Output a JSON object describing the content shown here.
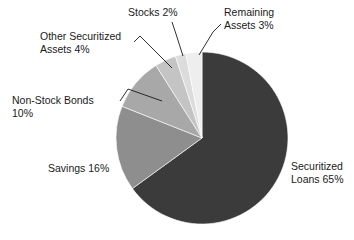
{
  "chart_data": {
    "type": "pie",
    "title": "",
    "subtitle": "",
    "xlabel": "",
    "ylabel": "",
    "legend_position": "none",
    "grid": false,
    "labels_position": "outside-with-leader-lines",
    "start_angle_deg": 0,
    "direction": "clockwise",
    "background_color": "#ffffff",
    "categories": [
      "Securitized Loans",
      "Savings",
      "Non-Stock Bonds",
      "Other Securitized Assets",
      "Stocks",
      "Remaining Assets"
    ],
    "values": [
      65,
      16,
      10,
      4,
      2,
      3
    ],
    "unit": "%",
    "colors": [
      "#3b3b3b",
      "#8e8e8e",
      "#a8a8a8",
      "#c4c4c4",
      "#dcdcdc",
      "#eeeeee"
    ],
    "slices": [
      {
        "name": "Securitized Loans",
        "value": 65,
        "display": "Securitized\nLoans 65%",
        "color": "#3b3b3b",
        "start_deg": 0,
        "end_deg": 234
      },
      {
        "name": "Savings",
        "value": 16,
        "display": "Savings 16%",
        "color": "#8e8e8e",
        "start_deg": 234,
        "end_deg": 291.6
      },
      {
        "name": "Non-Stock Bonds",
        "value": 10,
        "display": "Non-Stock Bonds\n10%",
        "color": "#a8a8a8",
        "start_deg": 291.6,
        "end_deg": 327.6
      },
      {
        "name": "Other Securitized Assets",
        "value": 4,
        "display": "Other Securitized\nAssets 4%",
        "color": "#c4c4c4",
        "start_deg": 327.6,
        "end_deg": 342
      },
      {
        "name": "Stocks",
        "value": 2,
        "display": "Stocks 2%",
        "color": "#dcdcdc",
        "start_deg": 342,
        "end_deg": 349.2
      },
      {
        "name": "Remaining Assets",
        "value": 3,
        "display": "Remaining\nAssets 3%",
        "color": "#eeeeee",
        "start_deg": 349.2,
        "end_deg": 360
      }
    ]
  },
  "labels": {
    "securitized_loans": "Securitized\nLoans 65%",
    "savings": "Savings 16%",
    "non_stock_bonds": "Non-Stock Bonds\n10%",
    "other_securitized_assets": "Other Securitized\nAssets 4%",
    "stocks": "Stocks 2%",
    "remaining_assets": "Remaining\nAssets 3%"
  }
}
